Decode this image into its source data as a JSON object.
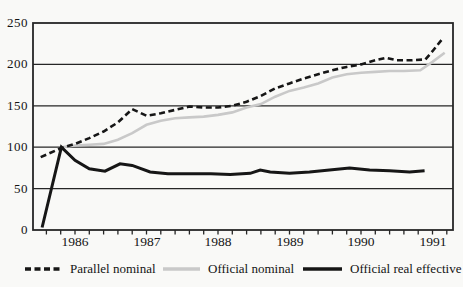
{
  "colors": {
    "background": "#f9f9f7",
    "axis": "#262626",
    "text": "#141414",
    "parallel_nominal": "#161616",
    "official_nominal": "#c9c9c9",
    "official_real": "#161616"
  },
  "chart_data": {
    "type": "line",
    "title": "",
    "xlabel": "",
    "ylabel": "",
    "grid": "horizontal",
    "legend_position": "bottom",
    "x_axis": {
      "labels": [
        "1986",
        "1987",
        "1988",
        "1989",
        "1990",
        "1991"
      ],
      "label_years": [
        1986,
        1987,
        1988,
        1989,
        1990,
        1991
      ],
      "range": [
        1985.41,
        1991.29
      ],
      "minor_tick_step": 0.2,
      "minor_tick_start": 1985.6,
      "minor_tick_end": 1991.2
    },
    "y_axis": {
      "ticks": [
        "0",
        "50",
        "100",
        "150",
        "200",
        "250"
      ],
      "tick_values": [
        0,
        50,
        100,
        150,
        200,
        250
      ],
      "range": [
        0,
        250
      ],
      "gridlines": [
        50,
        100,
        150,
        200
      ]
    },
    "series": [
      {
        "name": "Parallel nominal",
        "style": "dashed",
        "color": "#161616",
        "x": [
          1985.52,
          1985.81,
          1986.0,
          1986.2,
          1986.4,
          1986.6,
          1986.8,
          1987.0,
          1987.2,
          1987.4,
          1987.6,
          1987.8,
          1988.0,
          1988.2,
          1988.4,
          1988.6,
          1988.8,
          1989.0,
          1989.2,
          1989.4,
          1989.6,
          1989.8,
          1990.0,
          1990.2,
          1990.35,
          1990.5,
          1990.7,
          1990.9,
          1991.0,
          1991.14
        ],
        "y": [
          88,
          99,
          104,
          111,
          119,
          130,
          146,
          138,
          141,
          145,
          149,
          148,
          148,
          150,
          155,
          162,
          171,
          177,
          183,
          188,
          193,
          197,
          200,
          205,
          208,
          205,
          205,
          206,
          216,
          231
        ]
      },
      {
        "name": "Official nominal",
        "style": "solid",
        "color": "#c9c9c9",
        "x": [
          1985.81,
          1986.0,
          1986.2,
          1986.4,
          1986.6,
          1986.8,
          1987.0,
          1987.2,
          1987.4,
          1987.6,
          1987.8,
          1988.0,
          1988.2,
          1988.4,
          1988.6,
          1988.8,
          1989.0,
          1989.2,
          1989.4,
          1989.6,
          1989.8,
          1990.0,
          1990.2,
          1990.4,
          1990.6,
          1990.83,
          1991.0,
          1991.17
        ],
        "y": [
          100,
          102,
          103,
          104,
          109,
          117,
          127,
          132,
          135,
          136,
          137,
          139,
          142,
          148,
          152,
          161,
          168,
          172,
          177,
          184,
          188,
          190,
          191,
          192,
          192,
          193,
          203,
          214
        ]
      },
      {
        "name": "Official real effective",
        "style": "solid-thick",
        "color": "#161616",
        "x": [
          1985.54,
          1985.81,
          1986.0,
          1986.2,
          1986.42,
          1986.63,
          1986.8,
          1987.05,
          1987.3,
          1987.6,
          1987.9,
          1988.17,
          1988.45,
          1988.59,
          1988.73,
          1989.0,
          1989.28,
          1989.56,
          1989.84,
          1990.12,
          1990.4,
          1990.68,
          1990.89
        ],
        "y": [
          3,
          100,
          84,
          74,
          71,
          80,
          78,
          70,
          68,
          68,
          68,
          67,
          68.5,
          72.5,
          70,
          68.5,
          70,
          72.5,
          75,
          72.5,
          71.5,
          70,
          71.5
        ]
      }
    ]
  }
}
